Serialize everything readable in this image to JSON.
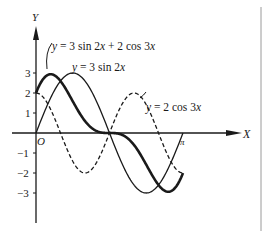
{
  "chart_data": {
    "type": "line",
    "title": "",
    "xlabel": "X",
    "ylabel": "Y",
    "origin_label": "O",
    "x_tick_labels": [
      "π"
    ],
    "y_tick_labels": [
      "3",
      "2",
      "1",
      "−1",
      "−2",
      "−3"
    ],
    "y_ticks": [
      3,
      2,
      1,
      -1,
      -2,
      -3
    ],
    "xlim": [
      0,
      3.14159
    ],
    "ylim": [
      -3.5,
      4
    ],
    "grid": false,
    "legend": "inline annotations",
    "series": [
      {
        "name": "y = 3 sin 2x + 2 cos 3x",
        "style": "thick solid",
        "expression": "3*sin(2x)+2*cos(3x)",
        "x": [
          0,
          0.3927,
          0.7854,
          1.1781,
          1.5708,
          1.9635,
          2.3562,
          2.7489,
          3.1416
        ],
        "values": [
          2.0,
          2.88,
          1.59,
          -0.62,
          0.0,
          0.06,
          -1.59,
          -2.91,
          -2.0
        ]
      },
      {
        "name": "y = 3 sin 2x",
        "style": "thin solid",
        "expression": "3*sin(2x)",
        "x": [
          0,
          0.3927,
          0.7854,
          1.1781,
          1.5708,
          1.9635,
          2.3562,
          2.7489,
          3.1416
        ],
        "values": [
          0.0,
          2.12,
          3.0,
          2.12,
          0.0,
          -2.12,
          -3.0,
          -2.12,
          0.0
        ]
      },
      {
        "name": "y = 2 cos 3x",
        "style": "dashed",
        "expression": "2*cos(3x)",
        "x": [
          0,
          0.3927,
          0.7854,
          1.1781,
          1.5708,
          1.9635,
          2.3562,
          2.7489,
          3.1416
        ],
        "values": [
          2.0,
          0.77,
          -1.41,
          -1.85,
          0.0,
          1.85,
          1.41,
          -0.77,
          -2.0
        ]
      }
    ],
    "annotations": [
      {
        "text": "y = 3 sin 2x + 2 cos 3x",
        "target_series": 0
      },
      {
        "text": "y = 3 sin 2x",
        "target_series": 1
      },
      {
        "text": "y = 2 cos 3x",
        "target_series": 2
      }
    ]
  },
  "labels": {
    "y_axis": "Y",
    "x_axis": "X",
    "origin": "O",
    "pi": "π",
    "eq_sum": "y = 3 sin 2x + 2 cos 3x",
    "eq_sin": "y = 3 sin 2x",
    "eq_cos": "y = 2 cos 3x",
    "ticks": {
      "p3": "3",
      "p2": "2",
      "p1": "1",
      "m1": "−1",
      "m2": "−2",
      "m3": "−3"
    }
  },
  "colors": {
    "ink": "#1a1a1a",
    "border": "#9a9a9a",
    "background": "#ffffff"
  }
}
